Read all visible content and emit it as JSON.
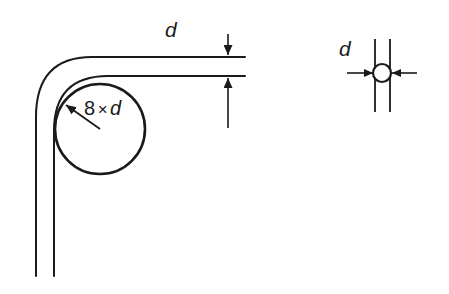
{
  "figure": {
    "background_color": "#ffffff",
    "line_color": "#1a1a1a",
    "width": 449,
    "height": 294
  },
  "labels": {
    "d_top": "d",
    "d_right": "d",
    "bend_radius_number": "8",
    "bend_radius_times": "×",
    "bend_radius_symbol": "d"
  },
  "left_figure": {
    "name": "bent-strip-with-bend-circle",
    "description": "Strip bent through 90 degrees with an inscribed circle showing the bend radius",
    "bend_circle": {
      "center_x": 100,
      "center_y": 129,
      "radius": 45
    },
    "leader_line": {
      "from_x": 100,
      "from_y": 129,
      "to_x": 63,
      "to_y": 103
    },
    "outer_strip_line": {
      "horizontal_y": 57,
      "vertical_x": 36,
      "bottom_y": 276
    },
    "inner_strip_line": {
      "horizontal_y": 76,
      "vertical_x": 54,
      "bottom_y": 276
    },
    "thickness_dimension": {
      "x": 228,
      "upper_arrow_from_y": 34,
      "upper_arrow_to_y": 57,
      "lower_arrow_from_y": 128,
      "lower_arrow_to_y": 76
    },
    "horizontal_extent_x": 245
  },
  "right_figure": {
    "name": "wire-diameter-detail",
    "description": "Small circle between two vertical lines with two inward pointing arrows marking the diameter d",
    "circle": {
      "center_x": 381,
      "center_y": 73,
      "radius": 9
    },
    "vertical_lines": [
      {
        "x": 375,
        "top_y": 39,
        "bottom_y": 112
      },
      {
        "x": 390,
        "top_y": 39,
        "bottom_y": 112
      }
    ],
    "arrows": [
      {
        "from_x": 347,
        "from_y": 73,
        "to_x": 371,
        "to_y": 73,
        "direction": "right"
      },
      {
        "from_x": 417,
        "from_y": 73,
        "to_x": 392,
        "to_y": 73,
        "direction": "left"
      }
    ]
  }
}
